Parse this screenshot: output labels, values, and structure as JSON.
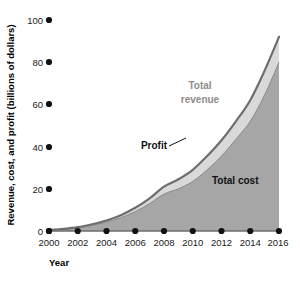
{
  "chart_data": {
    "type": "area",
    "title": "",
    "subtitle": "",
    "xlabel": "Year",
    "ylabel": "Revenue, cost, and profit (billions of dollars)",
    "xlim": [
      2000,
      2016
    ],
    "ylim": [
      0,
      100
    ],
    "grid": false,
    "legend_position": "inline-annotations",
    "x_tick_labels": [
      "2000",
      "2002",
      "2004",
      "2006",
      "2008",
      "2010",
      "2012",
      "2014",
      "2016"
    ],
    "x_ticks": [
      2000,
      2002,
      2004,
      2006,
      2008,
      2010,
      2012,
      2014,
      2016
    ],
    "y_tick_labels": [
      "0",
      "20",
      "40",
      "60",
      "80",
      "100"
    ],
    "y_ticks": [
      0,
      20,
      40,
      60,
      80,
      100
    ],
    "x": [
      2000,
      2001,
      2002,
      2003,
      2004,
      2005,
      2006,
      2007,
      2008,
      2009,
      2010,
      2011,
      2012,
      2013,
      2014,
      2015,
      2016
    ],
    "series": [
      {
        "name": "Total revenue",
        "color": "#d9d9d9",
        "outline_color": "#6e6e6e",
        "values": [
          0.5,
          1.0,
          1.8,
          3.2,
          5.0,
          7.5,
          11.0,
          15.5,
          21.0,
          24.5,
          29.0,
          35.5,
          43.0,
          52.0,
          62.0,
          76.0,
          92.0
        ]
      },
      {
        "name": "Total cost",
        "color": "#a6a6a6",
        "outline_color": "#8a8a8a",
        "values": [
          0.4,
          0.8,
          1.5,
          2.7,
          4.2,
          6.3,
          9.2,
          13.0,
          17.5,
          20.0,
          23.5,
          29.0,
          35.5,
          43.5,
          52.0,
          64.5,
          80.0
        ]
      }
    ],
    "annotations": [
      {
        "text": "Total revenue",
        "line1": "Total",
        "line2": "revenue",
        "style": "gray"
      },
      {
        "text": "Profit",
        "style": "dark",
        "has_leader_line": true
      },
      {
        "text": "Total cost",
        "style": "dark"
      }
    ]
  },
  "labels": {
    "y_axis_title": "Revenue, cost, and profit (billions of dollars)",
    "x_axis_title": "Year",
    "total_revenue_line1": "Total",
    "total_revenue_line2": "revenue",
    "profit": "Profit",
    "total_cost": "Total cost",
    "y_tick_100": "100",
    "y_tick_80": "80",
    "y_tick_60": "60",
    "y_tick_40": "40",
    "y_tick_20": "20",
    "y_tick_0": "0",
    "x_tick_2000": "2000",
    "x_tick_2002": "2002",
    "x_tick_2004": "2004",
    "x_tick_2006": "2006",
    "x_tick_2008": "2008",
    "x_tick_2010": "2010",
    "x_tick_2012": "2012",
    "x_tick_2014": "2014",
    "x_tick_2016": "2016"
  },
  "colors": {
    "total_cost_fill": "#a6a6a6",
    "profit_band_fill": "#d9d9d9",
    "revenue_outline": "#6e6e6e",
    "cost_outline": "#8f8f8f",
    "tick_dot": "#111111",
    "text": "#111111",
    "gray_label": "#8d8d8d",
    "background": "#ffffff"
  }
}
